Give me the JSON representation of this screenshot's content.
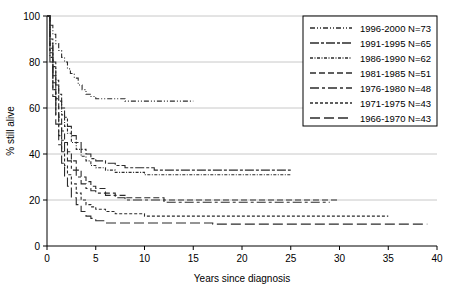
{
  "chart_data": {
    "type": "line",
    "title": "",
    "xlabel": "Years since diagnosis",
    "ylabel": "% still alive",
    "xlim": [
      0,
      40
    ],
    "ylim": [
      0,
      100
    ],
    "xticks": [
      "0",
      "5",
      "10",
      "15",
      "20",
      "25",
      "30",
      "35",
      "40"
    ],
    "yticks": [
      "0",
      "20",
      "40",
      "60",
      "80",
      "100"
    ],
    "grid": "horizontal",
    "legend_position": "top-right",
    "series": [
      {
        "name": "1996-2000 N=73",
        "label": "1996-2000 N=73",
        "dash": "dash-dot-dot-fine",
        "plateau": 63,
        "end_x": 15,
        "points": [
          [
            0,
            100
          ],
          [
            0.3,
            96
          ],
          [
            0.6,
            92
          ],
          [
            0.9,
            88
          ],
          [
            1.2,
            85
          ],
          [
            1.5,
            82
          ],
          [
            1.8,
            80
          ],
          [
            2.1,
            77
          ],
          [
            2.4,
            75
          ],
          [
            2.8,
            73
          ],
          [
            3.2,
            70
          ],
          [
            3.6,
            68
          ],
          [
            4.0,
            66
          ],
          [
            4.5,
            65
          ],
          [
            5.0,
            64
          ],
          [
            6.0,
            64
          ],
          [
            7.0,
            64
          ],
          [
            8.0,
            63
          ],
          [
            9.0,
            63
          ],
          [
            10.0,
            63
          ],
          [
            11.5,
            63
          ],
          [
            13.0,
            63
          ],
          [
            15.0,
            63
          ]
        ]
      },
      {
        "name": "1991-1995 N=65",
        "label": "1991-1995 N=65",
        "dash": "long-dash-dot",
        "plateau": 33,
        "end_x": 25,
        "points": [
          [
            0,
            100
          ],
          [
            0.3,
            90
          ],
          [
            0.6,
            80
          ],
          [
            0.9,
            72
          ],
          [
            1.2,
            66
          ],
          [
            1.5,
            60
          ],
          [
            1.8,
            56
          ],
          [
            2.1,
            52
          ],
          [
            2.5,
            48
          ],
          [
            3.0,
            45
          ],
          [
            3.5,
            42
          ],
          [
            4.0,
            40
          ],
          [
            4.5,
            38
          ],
          [
            5.0,
            37
          ],
          [
            6.0,
            36
          ],
          [
            7.0,
            35
          ],
          [
            8.0,
            34
          ],
          [
            9.5,
            34
          ],
          [
            11.0,
            33
          ],
          [
            13.0,
            33
          ],
          [
            15.0,
            33
          ],
          [
            18.0,
            33
          ],
          [
            21.0,
            33
          ],
          [
            25.0,
            33
          ]
        ]
      },
      {
        "name": "1986-1990 N=62",
        "label": "1986-1990 N=62",
        "dash": "fine-dash-dot",
        "plateau": 31,
        "end_x": 25,
        "points": [
          [
            0,
            100
          ],
          [
            0.3,
            88
          ],
          [
            0.6,
            78
          ],
          [
            0.9,
            70
          ],
          [
            1.2,
            63
          ],
          [
            1.5,
            57
          ],
          [
            1.8,
            52
          ],
          [
            2.1,
            49
          ],
          [
            2.5,
            45
          ],
          [
            3.0,
            42
          ],
          [
            3.5,
            39
          ],
          [
            4.0,
            37
          ],
          [
            4.5,
            35
          ],
          [
            5.0,
            34
          ],
          [
            6.0,
            33
          ],
          [
            7.0,
            32
          ],
          [
            8.5,
            32
          ],
          [
            10.0,
            31
          ],
          [
            12.0,
            31
          ],
          [
            14.0,
            31
          ],
          [
            17.0,
            31
          ],
          [
            20.0,
            31
          ],
          [
            23.0,
            31
          ],
          [
            25.0,
            31
          ]
        ]
      },
      {
        "name": "1981-1985 N=51",
        "label": "1981-1985 N=51",
        "dash": "medium-dash",
        "plateau": 20,
        "end_x": 30,
        "points": [
          [
            0,
            100
          ],
          [
            0.3,
            86
          ],
          [
            0.6,
            74
          ],
          [
            0.9,
            64
          ],
          [
            1.2,
            56
          ],
          [
            1.5,
            50
          ],
          [
            1.8,
            45
          ],
          [
            2.1,
            41
          ],
          [
            2.5,
            37
          ],
          [
            3.0,
            33
          ],
          [
            3.5,
            30
          ],
          [
            4.0,
            28
          ],
          [
            4.5,
            26
          ],
          [
            5.0,
            25
          ],
          [
            6.0,
            23
          ],
          [
            7.0,
            22
          ],
          [
            8.0,
            21
          ],
          [
            10.0,
            21
          ],
          [
            12.0,
            20
          ],
          [
            15.0,
            20
          ],
          [
            18.0,
            20
          ],
          [
            22.0,
            20
          ],
          [
            26.0,
            20
          ],
          [
            30.0,
            20
          ]
        ]
      },
      {
        "name": "1976-1980 N=48",
        "label": "1976-1980 N=48",
        "dash": "long-dash-short-dash",
        "plateau": 19,
        "end_x": 29,
        "points": [
          [
            0,
            100
          ],
          [
            0.3,
            84
          ],
          [
            0.6,
            71
          ],
          [
            0.9,
            61
          ],
          [
            1.2,
            53
          ],
          [
            1.5,
            46
          ],
          [
            1.8,
            41
          ],
          [
            2.1,
            37
          ],
          [
            2.5,
            33
          ],
          [
            3.0,
            30
          ],
          [
            3.5,
            27
          ],
          [
            4.0,
            25
          ],
          [
            4.5,
            24
          ],
          [
            5.0,
            23
          ],
          [
            6.0,
            22
          ],
          [
            7.0,
            21
          ],
          [
            8.0,
            20
          ],
          [
            10.0,
            20
          ],
          [
            12.0,
            19
          ],
          [
            15.0,
            19
          ],
          [
            19.0,
            19
          ],
          [
            23.0,
            19
          ],
          [
            26.0,
            19
          ],
          [
            29.0,
            19
          ]
        ]
      },
      {
        "name": "1971-1975 N=43",
        "label": "1971-1975 N=43",
        "dash": "short-dash",
        "plateau": 13,
        "end_x": 35,
        "points": [
          [
            0,
            100
          ],
          [
            0.3,
            82
          ],
          [
            0.6,
            68
          ],
          [
            0.9,
            57
          ],
          [
            1.2,
            48
          ],
          [
            1.5,
            41
          ],
          [
            1.8,
            35
          ],
          [
            2.1,
            31
          ],
          [
            2.5,
            27
          ],
          [
            3.0,
            23
          ],
          [
            3.5,
            20
          ],
          [
            4.0,
            18
          ],
          [
            4.5,
            17
          ],
          [
            5.0,
            16
          ],
          [
            6.0,
            15
          ],
          [
            7.0,
            14
          ],
          [
            8.0,
            14
          ],
          [
            10.0,
            13
          ],
          [
            13.0,
            13
          ],
          [
            16.0,
            13
          ],
          [
            20.0,
            13
          ],
          [
            25.0,
            13
          ],
          [
            30.0,
            13
          ],
          [
            35.0,
            13
          ]
        ]
      },
      {
        "name": "1966-1970 N=43",
        "label": "1966-1970 N=43",
        "dash": "long-dash",
        "plateau": 9.5,
        "end_x": 39,
        "points": [
          [
            0,
            100
          ],
          [
            0.3,
            80
          ],
          [
            0.6,
            65
          ],
          [
            0.9,
            53
          ],
          [
            1.2,
            44
          ],
          [
            1.5,
            36
          ],
          [
            1.8,
            30
          ],
          [
            2.1,
            26
          ],
          [
            2.5,
            21
          ],
          [
            3.0,
            18
          ],
          [
            3.5,
            15
          ],
          [
            4.0,
            13
          ],
          [
            4.5,
            12
          ],
          [
            5.0,
            11
          ],
          [
            6.0,
            10
          ],
          [
            7.0,
            10
          ],
          [
            8.0,
            10
          ],
          [
            10.0,
            10
          ],
          [
            13.0,
            10
          ],
          [
            17.0,
            9.5
          ],
          [
            22.0,
            9.5
          ],
          [
            28.0,
            9.5
          ],
          [
            34.0,
            9.5
          ],
          [
            39.0,
            9.5
          ]
        ]
      }
    ]
  }
}
